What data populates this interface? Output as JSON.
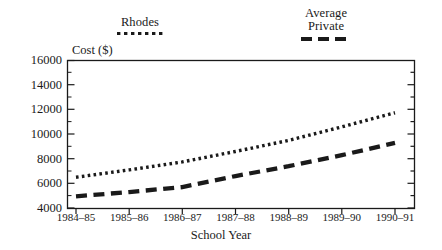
{
  "chart_data": {
    "type": "line",
    "title": "",
    "xlabel": "School Year",
    "ylabel": "Cost ($)",
    "categories": [
      "1984–85",
      "1985–86",
      "1986–87",
      "1987–88",
      "1988–89",
      "1989–90",
      "1990–91"
    ],
    "ylim": [
      4000,
      16000
    ],
    "yticks": [
      4000,
      6000,
      8000,
      10000,
      12000,
      14000,
      16000
    ],
    "ytick_labels": [
      "4000",
      "6000",
      "8000",
      "10000",
      "12000",
      "14000",
      "16000"
    ],
    "minor_ticks": true,
    "grid": false,
    "legend_position": "above-plot",
    "series": [
      {
        "name": "Rhodes",
        "style": "dotted",
        "color": "#1a1a1a",
        "values": [
          6500,
          7100,
          7750,
          8600,
          9500,
          10600,
          11750
        ]
      },
      {
        "name": "Average Private",
        "style": "dashed",
        "color": "#1a1a1a",
        "values": [
          4950,
          5300,
          5700,
          6600,
          7400,
          8300,
          9300
        ]
      }
    ]
  },
  "legend": {
    "rhodes": {
      "label": "Rhodes",
      "sample": "dotted-line-sample"
    },
    "private": {
      "label_line1": "Average",
      "label_line2": "Private",
      "sample": "dashed-line-sample"
    }
  },
  "axes": {
    "y_title": "Cost ($)",
    "x_title": "School Year"
  }
}
